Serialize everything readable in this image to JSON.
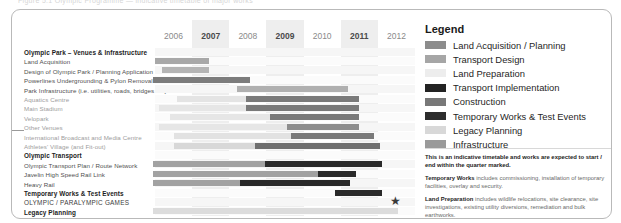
{
  "top_crop_text": "Figure 5.1  Olympic Programme — indicative timetable of major works",
  "chart_data": {
    "type": "gantt",
    "xlabel": "",
    "ylabel": "",
    "years": [
      {
        "label": "2006",
        "shaded": false,
        "emphasis": false
      },
      {
        "label": "2007",
        "shaded": true,
        "emphasis": true
      },
      {
        "label": "2008",
        "shaded": false,
        "emphasis": false
      },
      {
        "label": "2009",
        "shaded": true,
        "emphasis": true
      },
      {
        "label": "2010",
        "shaded": false,
        "emphasis": false
      },
      {
        "label": "2011",
        "shaded": true,
        "emphasis": true
      },
      {
        "label": "2012",
        "shaded": false,
        "emphasis": false
      }
    ],
    "x_start_year": 2006,
    "x_end_year": 2013,
    "categories": [
      "Olympic Park – Venues & Infrastructure",
      "Land Acquisition",
      "Design of Olympic Park / Planning Application",
      "Powerlines Undergrounding & Pylon Removal",
      "Park Infrastructure (i.e. utilities, roads, bridges etc)",
      "Aquatics Centre",
      "Main Stadium",
      "Velopark",
      "Other Venues",
      "International Broadcast and Media Centre",
      "Athletes' Village  (and Fit-out)",
      "Olympic Transport",
      "Olympic Transport Plan / Route Network",
      "Javelin High Speed Rail Link",
      "Heavy Rail",
      "Temporary Works & Test Events",
      "OLYMPIC / PARALYMPIC GAMES",
      "Legacy Planning"
    ],
    "rows": [
      {
        "label": "Olympic Park – Venues & Infrastructure",
        "style": "section",
        "bars": []
      },
      {
        "label": "Land Acquisition",
        "style": "normal",
        "bars": [
          {
            "category": "Land Acquisition / Planning",
            "start": 2006.0,
            "end": 2007.45,
            "color": "#a8a8a8"
          }
        ]
      },
      {
        "label": "Design of Olympic Park / Planning Application",
        "style": "normal",
        "bars": [
          {
            "category": "Land Acquisition / Planning",
            "start": 2006.2,
            "end": 2007.45,
            "color": "#b4b4b4"
          }
        ]
      },
      {
        "label": "Powerlines Undergrounding & Pylon Removal",
        "style": "normal",
        "bars": [
          {
            "category": "Infrastructure",
            "start": 2005.95,
            "end": 2008.55,
            "color": "#7c7c7c"
          }
        ]
      },
      {
        "label": "Park Infrastructure (i.e. utilities, roads, bridges etc)",
        "style": "normal",
        "bars": [
          {
            "category": "Infrastructure",
            "start": 2008.2,
            "end": 2011.2,
            "color": "#b0b0b0"
          }
        ]
      },
      {
        "label": "Aquatics Centre",
        "style": "faded",
        "bars": [
          {
            "category": "Land Preparation",
            "start": 2006.6,
            "end": 2008.45,
            "color": "#e4e4e4"
          },
          {
            "category": "Construction",
            "start": 2008.45,
            "end": 2011.5,
            "color": "#7a7a7a"
          }
        ]
      },
      {
        "label": "Main Stadium",
        "style": "faded",
        "bars": [
          {
            "category": "Land Preparation",
            "start": 2006.1,
            "end": 2008.45,
            "color": "#e6e6e6"
          },
          {
            "category": "Construction",
            "start": 2008.45,
            "end": 2011.5,
            "color": "#7a7a7a"
          }
        ]
      },
      {
        "label": "Velopark",
        "style": "faded",
        "bars": [
          {
            "category": "Land Preparation",
            "start": 2006.4,
            "end": 2009.1,
            "color": "#e6e6e6"
          },
          {
            "category": "Construction",
            "start": 2009.1,
            "end": 2011.5,
            "color": "#7a7a7a"
          }
        ]
      },
      {
        "label": "Other Venues",
        "style": "faded",
        "bars": [
          {
            "category": "Land Preparation",
            "start": 2006.1,
            "end": 2009.55,
            "color": "#e6e6e6"
          },
          {
            "category": "Construction",
            "start": 2009.55,
            "end": 2011.5,
            "color": "#8d8d8d"
          }
        ]
      },
      {
        "label": "International Broadcast and Media Centre",
        "style": "faded",
        "bars": [
          {
            "category": "Land Preparation",
            "start": 2006.5,
            "end": 2009.65,
            "color": "#e2e2e2"
          },
          {
            "category": "Construction",
            "start": 2009.65,
            "end": 2011.9,
            "color": "#7a7a7a"
          }
        ]
      },
      {
        "label": "Athletes' Village  (and Fit-out)",
        "style": "faded",
        "bars": [
          {
            "category": "Land Preparation",
            "start": 2006.5,
            "end": 2008.7,
            "color": "#d8d8d8"
          },
          {
            "category": "Construction",
            "start": 2008.7,
            "end": 2012.05,
            "color": "#6f6f6f"
          }
        ]
      },
      {
        "label": "Olympic Transport",
        "style": "section",
        "bars": []
      },
      {
        "label": "Olympic Transport Plan / Route Network",
        "style": "normal",
        "bars": [
          {
            "category": "Transport Design",
            "start": 2005.95,
            "end": 2008.95,
            "color": "#a2a2a2"
          },
          {
            "category": "Transport Implementation",
            "start": 2008.95,
            "end": 2012.1,
            "color": "#2a2a2a"
          }
        ]
      },
      {
        "label": "Javelin High Speed Rail Link",
        "style": "normal",
        "bars": [
          {
            "category": "Transport Design",
            "start": 2005.95,
            "end": 2010.4,
            "color": "#a2a2a2"
          },
          {
            "category": "Transport Implementation",
            "start": 2010.4,
            "end": 2011.4,
            "color": "#2a2a2a"
          }
        ]
      },
      {
        "label": "Heavy Rail",
        "style": "normal",
        "bars": [
          {
            "category": "Transport Design",
            "start": 2005.95,
            "end": 2008.3,
            "color": "#a2a2a2"
          },
          {
            "category": "Transport Implementation",
            "start": 2008.3,
            "end": 2011.25,
            "color": "#2a2a2a"
          }
        ]
      },
      {
        "label": "Temporary Works & Test Events",
        "style": "section",
        "bars": [
          {
            "category": "Temporary Works & Test Events",
            "start": 2010.85,
            "end": 2012.1,
            "color": "#2a2a2a"
          }
        ]
      },
      {
        "label": "OLYMPIC / PARALYMPIC GAMES",
        "style": "caps",
        "bars": [],
        "marker": {
          "shape": "star",
          "at": 2012.45,
          "color": "#3a3a3a"
        }
      },
      {
        "label": "Legacy Planning",
        "style": "section",
        "bars": [
          {
            "category": "Legacy Planning",
            "start": 2005.95,
            "end": 2012.55,
            "color": "#dcdcdc"
          }
        ]
      }
    ],
    "legend_position": "right",
    "grid": true
  },
  "legend": {
    "title": "Legend",
    "items": [
      {
        "label": "Land Acquisition / Planning",
        "color": "#8c8c8c"
      },
      {
        "label": "Transport Design",
        "color": "#a6a6a6"
      },
      {
        "label": "Land Preparation",
        "color": "#ededed"
      },
      {
        "label": "Transport Implementation",
        "color": "#232323"
      },
      {
        "label": "Construction",
        "color": "#787878"
      },
      {
        "label": "Temporary Works & Test Events",
        "color": "#2d2d2d"
      },
      {
        "label": "Legacy Planning",
        "color": "#d8d8d8"
      },
      {
        "label": "Infrastructure",
        "color": "#9a9a9a"
      }
    ],
    "notes": [
      {
        "bold_lead": "",
        "text": "This is an indicative timetable and works are expected to start / end within the quarter marked.",
        "all_bold": true
      },
      {
        "bold_lead": "Temporary Works",
        "text": " includes commissioning, installation of temporary facilities, overlay and security.",
        "all_bold": false
      },
      {
        "bold_lead": "Land Preparation",
        "text": " includes wildlife relocations, site clearance, site investigations, existing utility diversions, remediation and bulk earthworks.",
        "all_bold": false
      }
    ]
  }
}
